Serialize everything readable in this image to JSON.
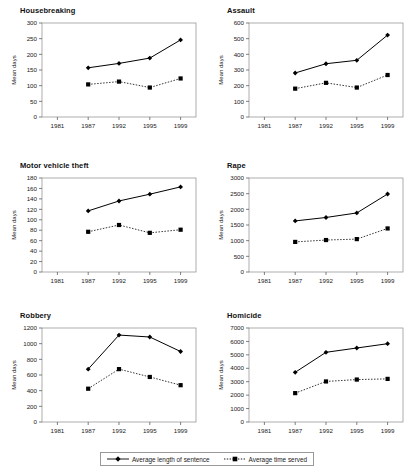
{
  "figure": {
    "x_categories": [
      "1981",
      "1987",
      "1992",
      "1995",
      "1999"
    ],
    "y_axis_label": "Mean days",
    "legend": {
      "series": [
        {
          "label": "Average length of sentence",
          "marker": "diamond-marker",
          "line": "solid",
          "color": "#000000"
        },
        {
          "label": "Average time served",
          "marker": "square-marker",
          "line": "dotted",
          "color": "#000000"
        }
      ]
    }
  },
  "chart_data": [
    {
      "type": "line",
      "title": "Housebreaking",
      "xlabel": "",
      "ylabel": "Mean days",
      "x": [
        "1981",
        "1987",
        "1992",
        "1995",
        "1999"
      ],
      "ylim": [
        0,
        300
      ],
      "yticks": [
        0,
        50,
        100,
        150,
        200,
        250,
        300
      ],
      "grid": false,
      "legend_position": "figure-bottom-center",
      "series": [
        {
          "name": "Average length of sentence",
          "values": [
            null,
            157,
            171,
            188,
            246
          ]
        },
        {
          "name": "Average time served",
          "values": [
            null,
            104,
            113,
            94,
            123
          ]
        }
      ]
    },
    {
      "type": "line",
      "title": "Assault",
      "xlabel": "",
      "ylabel": "Mean days",
      "x": [
        "1981",
        "1987",
        "1992",
        "1995",
        "1999"
      ],
      "ylim": [
        0,
        600
      ],
      "yticks": [
        0,
        100,
        200,
        300,
        400,
        500,
        600
      ],
      "grid": false,
      "legend_position": "figure-bottom-center",
      "series": [
        {
          "name": "Average length of sentence",
          "values": [
            null,
            281,
            340,
            362,
            523
          ]
        },
        {
          "name": "Average time served",
          "values": [
            null,
            181,
            218,
            188,
            268
          ]
        }
      ]
    },
    {
      "type": "line",
      "title": "Motor vehicle theft",
      "xlabel": "",
      "ylabel": "Mean days",
      "x": [
        "1981",
        "1987",
        "1992",
        "1995",
        "1999"
      ],
      "ylim": [
        0,
        180
      ],
      "yticks": [
        0,
        20,
        40,
        60,
        80,
        100,
        120,
        140,
        160,
        180
      ],
      "grid": false,
      "legend_position": "figure-bottom-center",
      "series": [
        {
          "name": "Average length of sentence",
          "values": [
            null,
            117,
            136,
            149,
            163
          ]
        },
        {
          "name": "Average time served",
          "values": [
            null,
            77,
            90,
            75,
            81
          ]
        }
      ]
    },
    {
      "type": "line",
      "title": "Rape",
      "xlabel": "",
      "ylabel": "Mean days",
      "x": [
        "1981",
        "1987",
        "1992",
        "1995",
        "1999"
      ],
      "ylim": [
        0,
        3000
      ],
      "yticks": [
        0,
        500,
        1000,
        1500,
        2000,
        2500,
        3000
      ],
      "grid": false,
      "legend_position": "figure-bottom-center",
      "series": [
        {
          "name": "Average length of sentence",
          "values": [
            null,
            1630,
            1740,
            1885,
            2490
          ]
        },
        {
          "name": "Average time served",
          "values": [
            null,
            960,
            1020,
            1050,
            1390
          ]
        }
      ]
    },
    {
      "type": "line",
      "title": "Robbery",
      "xlabel": "",
      "ylabel": "Mean days",
      "x": [
        "1981",
        "1987",
        "1992",
        "1995",
        "1999"
      ],
      "ylim": [
        0,
        1200
      ],
      "yticks": [
        0,
        200,
        400,
        600,
        800,
        1000,
        1200
      ],
      "grid": false,
      "legend_position": "figure-bottom-center",
      "series": [
        {
          "name": "Average length of sentence",
          "values": [
            null,
            675,
            1110,
            1085,
            900
          ]
        },
        {
          "name": "Average time served",
          "values": [
            null,
            425,
            675,
            575,
            470
          ]
        }
      ]
    },
    {
      "type": "line",
      "title": "Homicide",
      "xlabel": "",
      "ylabel": "Mean days",
      "x": [
        "1981",
        "1987",
        "1992",
        "1995",
        "1999"
      ],
      "ylim": [
        0,
        7000
      ],
      "yticks": [
        0,
        1000,
        2000,
        3000,
        4000,
        5000,
        6000,
        7000
      ],
      "grid": false,
      "legend_position": "figure-bottom-center",
      "series": [
        {
          "name": "Average length of sentence",
          "values": [
            null,
            3700,
            5190,
            5510,
            5830
          ]
        },
        {
          "name": "Average time served",
          "values": [
            null,
            2150,
            3020,
            3160,
            3210
          ]
        }
      ]
    }
  ]
}
